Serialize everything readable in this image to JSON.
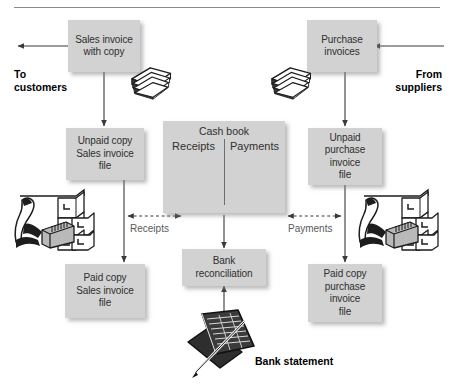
{
  "diagram": {
    "title_rule": true,
    "boxes": {
      "sales_invoice": {
        "lines": [
          "Sales invoice",
          "with copy"
        ]
      },
      "purchase_invoices": {
        "lines": [
          "Purchase",
          "invoices"
        ]
      },
      "unpaid_sales": {
        "lines": [
          "Unpaid copy",
          "Sales invoice",
          "file"
        ]
      },
      "unpaid_purchase": {
        "lines": [
          "Unpaid",
          "purchase",
          "invoice",
          "file"
        ]
      },
      "paid_sales": {
        "lines": [
          "Paid copy",
          "Sales invoice",
          "file"
        ]
      },
      "paid_purchase": {
        "lines": [
          "Paid copy",
          "purchase",
          "invoice",
          "file"
        ]
      },
      "bank_reconciliation": {
        "lines": [
          "Bank",
          "reconciliation"
        ]
      },
      "cash_book": {
        "title": "Cash book",
        "left_column": "Receipts",
        "right_column": "Payments"
      }
    },
    "captions": {
      "to_customers": "To\ncustomers",
      "to_customers_l1": "To",
      "to_customers_l2": "customers",
      "from_suppliers_l1": "From",
      "from_suppliers_l2": "suppliers"
    },
    "flow_labels": {
      "receipts": "Receipts",
      "payments": "Payments"
    },
    "icon_labels": {
      "bank_statement": "Bank statement"
    },
    "icons": {
      "paper_stack_left": "paper-stack-icon",
      "paper_stack_right": "paper-stack-icon",
      "filing_clerk_left": "filing-cabinet-clerk-icon",
      "filing_clerk_right": "filing-cabinet-clerk-icon",
      "bank_statement": "bank-statement-ledger-icon"
    },
    "colors": {
      "box_fill": "#d2d2d2",
      "box_text": "#2f2f2f",
      "arrow": "#3a3a3a",
      "label_text": "#595959",
      "caption_text": "#000000",
      "rule": "#8a8a8a",
      "background": "#ffffff"
    }
  }
}
